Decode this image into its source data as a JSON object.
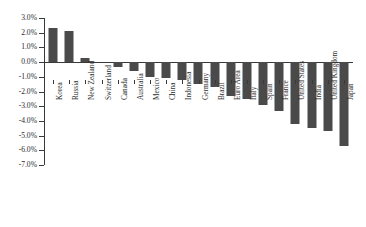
{
  "chart_data": {
    "type": "bar",
    "title": "",
    "subtitle": "",
    "xlabel": "",
    "ylabel": "",
    "grid": false,
    "legend": "none",
    "ylim": [
      -7.0,
      3.0
    ],
    "ytick_step": 1.0,
    "yticks": [
      "3.0%",
      "2.0%",
      "1.0%",
      "0.0%",
      "-1.0%",
      "-2.0%",
      "-3.0%",
      "-4.0%",
      "-5.0%",
      "-6.0%",
      "-7.0%"
    ],
    "ytick_values": [
      3.0,
      2.0,
      1.0,
      0.0,
      -1.0,
      -2.0,
      -3.0,
      -4.0,
      -5.0,
      -6.0,
      -7.0
    ],
    "bar_color": "#4a4a4a",
    "axis_color": "#3a3a3a",
    "categories": [
      "Korea",
      "Russia",
      "New Zealand",
      "Switzerland",
      "Canada",
      "Australia",
      "Mexico",
      "China",
      "Indonesia",
      "Germany",
      "Brazil",
      "Euro Area",
      "Italy",
      "Spain",
      "France",
      "United States",
      "India",
      "United Kingdom",
      "Japan"
    ],
    "values": [
      2.3,
      2.1,
      0.3,
      0.0,
      -0.3,
      -0.6,
      -1.0,
      -1.1,
      -1.2,
      -1.5,
      -1.7,
      -2.3,
      -2.5,
      -2.9,
      -3.3,
      -4.2,
      -4.5,
      -4.7,
      -5.7
    ]
  }
}
